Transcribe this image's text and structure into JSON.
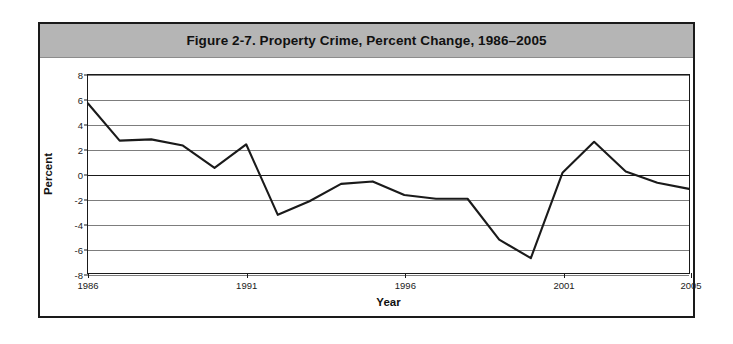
{
  "figure": {
    "title": "Figure 2-7. Property Crime, Percent Change, 1986–2005",
    "border_color": "#1a1a1a",
    "title_band_color": "#b5b5b5",
    "line_color": "#1a1a1a",
    "grid_color": "#7d7d7d",
    "background": "#ffffff"
  },
  "chart_data": {
    "type": "line",
    "title": "Figure 2-7. Property Crime, Percent Change, 1986–2005",
    "xlabel": "Year",
    "ylabel": "Percent",
    "x": [
      1986,
      1987,
      1988,
      1989,
      1990,
      1991,
      1992,
      1993,
      1994,
      1995,
      1996,
      1997,
      1998,
      1999,
      2000,
      2001,
      2002,
      2003,
      2004,
      2005
    ],
    "values": [
      5.7,
      2.7,
      2.8,
      2.3,
      0.5,
      2.4,
      -3.3,
      -2.2,
      -0.8,
      -0.6,
      -1.7,
      -2.0,
      -2.0,
      -5.3,
      -6.8,
      0.1,
      2.6,
      0.2,
      -0.7,
      -1.2
    ],
    "xlim": [
      1986,
      2005
    ],
    "ylim": [
      -8,
      8
    ],
    "yticks": [
      8,
      6,
      4,
      2,
      0,
      -2,
      -4,
      -6,
      -8
    ],
    "ytick_labels": [
      "8",
      "6",
      "4",
      "2",
      "0",
      "-2",
      "-4",
      "-6",
      "-8"
    ],
    "xticks": [
      1986,
      1991,
      1996,
      2001,
      2005
    ],
    "xtick_labels": [
      "1986",
      "1991",
      "1996",
      "2001",
      "2005"
    ],
    "grid": true,
    "grid_axis": "y",
    "legend": false,
    "series_name": "Property Crime Percent Change"
  }
}
